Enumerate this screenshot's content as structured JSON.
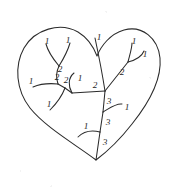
{
  "figure": {
    "type": "diagram",
    "background_color": "#ffffff",
    "stroke_color": "#2b2b2b",
    "label_color": "#1e1e1e",
    "width": 171,
    "height": 194,
    "outline": {
      "name": "heart-shaped-boundary",
      "description": "closed cardioid / heart outline enclosing the tree",
      "path": "M 96 160 C 78 146 46 128 30 108 C 16 90 14 66 24 48 C 35 29 60 22 78 32 C 88 38 94 48 97 56 C 101 46 110 34 124 30 C 142 25 158 38 160 58 C 162 80 148 104 132 124 C 118 142 104 154 96 160 Z"
    },
    "tree": {
      "name": "labelled-tree",
      "root_vertex": [
        96,
        160
      ],
      "edges": [
        {
          "id": "e-trunk-lower",
          "path": "M 96 160 L 100 132",
          "label": "3",
          "label_pos": [
            105,
            143
          ]
        },
        {
          "id": "e-trunk-mid",
          "path": "M 100 132 L 103 112",
          "label": "3",
          "label_pos": [
            108,
            123
          ]
        },
        {
          "id": "e-trunk-upper",
          "path": "M 103 112 L 105 91",
          "label": "3",
          "label_pos": [
            109,
            102
          ]
        },
        {
          "id": "e-left-curl",
          "path": "M 100 132 C 92 130 84 131 78 137",
          "label": "1",
          "label_pos": [
            86,
            127
          ]
        },
        {
          "id": "e-right-curl",
          "path": "M 103 112 C 110 108 116 103 122 104",
          "label": "1",
          "label_pos": [
            127,
            108
          ]
        },
        {
          "id": "e-node-bar",
          "path": "M 105 91 L 72 93",
          "label": "2",
          "label_pos": [
            95,
            86
          ]
        },
        {
          "id": "e-bar-left",
          "path": "M 72 93 L 65 88",
          "label": "2",
          "label_pos": [
            66,
            81
          ]
        },
        {
          "id": "e-center-hook",
          "path": "M 72 93 C 68 86 68 78 74 73",
          "label": "1",
          "label_pos": [
            80,
            79
          ]
        },
        {
          "id": "e-junction-2a",
          "path": "M 65 88 L 58 84",
          "label": "2",
          "label_pos": [
            57,
            78
          ]
        },
        {
          "id": "e-junction-2b",
          "path": "M 58 84 C 56 78 56 72 59 66",
          "label": "2",
          "label_pos": [
            60,
            70
          ]
        },
        {
          "id": "e-far-left-1",
          "path": "M 58 84 C 48 83 40 84 33 87",
          "label": "1",
          "label_pos": [
            31,
            82
          ]
        },
        {
          "id": "e-down-left-1",
          "path": "M 65 88 C 62 96 56 104 50 110",
          "label": "1",
          "label_pos": [
            49,
            105
          ]
        },
        {
          "id": "e-fork-left-1",
          "path": "M 59 66 C 54 60 48 52 46 44",
          "label": "1",
          "label_pos": [
            47,
            42
          ]
        },
        {
          "id": "e-fork-right-1",
          "path": "M 59 66 C 64 58 68 50 70 43",
          "label": "1",
          "label_pos": [
            68,
            41
          ]
        },
        {
          "id": "e-top-long-1",
          "path": "M 105 91 C 102 72 98 52 95 38",
          "label": "1",
          "label_pos": [
            99,
            38
          ]
        },
        {
          "id": "e-right-diag-2",
          "path": "M 105 91 L 128 62",
          "label": "2",
          "label_pos": [
            122,
            73
          ]
        },
        {
          "id": "e-right-up-1",
          "path": "M 128 62 C 130 54 132 48 132 43",
          "label": "1",
          "label_pos": [
            134,
            42
          ]
        },
        {
          "id": "e-right-hook-1",
          "path": "M 128 62 C 136 60 142 56 144 51",
          "label": "1",
          "label_pos": [
            145,
            55
          ]
        }
      ]
    },
    "labels": [
      {
        "text": "1",
        "x": 47,
        "y": 42
      },
      {
        "text": "1",
        "x": 68,
        "y": 41
      },
      {
        "text": "1",
        "x": 99,
        "y": 38
      },
      {
        "text": "1",
        "x": 134,
        "y": 42
      },
      {
        "text": "1",
        "x": 145,
        "y": 55
      },
      {
        "text": "2",
        "x": 57,
        "y": 78
      },
      {
        "text": "2",
        "x": 60,
        "y": 70
      },
      {
        "text": "2",
        "x": 66,
        "y": 81
      },
      {
        "text": "1",
        "x": 80,
        "y": 79
      },
      {
        "text": "2",
        "x": 95,
        "y": 86
      },
      {
        "text": "2",
        "x": 122,
        "y": 73
      },
      {
        "text": "1",
        "x": 31,
        "y": 82
      },
      {
        "text": "1",
        "x": 49,
        "y": 105
      },
      {
        "text": "3",
        "x": 109,
        "y": 102
      },
      {
        "text": "1",
        "x": 127,
        "y": 108
      },
      {
        "text": "3",
        "x": 108,
        "y": 123
      },
      {
        "text": "1",
        "x": 86,
        "y": 127
      },
      {
        "text": "3",
        "x": 105,
        "y": 143
      }
    ],
    "label_values": [
      "1",
      "2",
      "3"
    ],
    "label_counts": {
      "1": 9,
      "2": 5,
      "3": 3
    }
  }
}
